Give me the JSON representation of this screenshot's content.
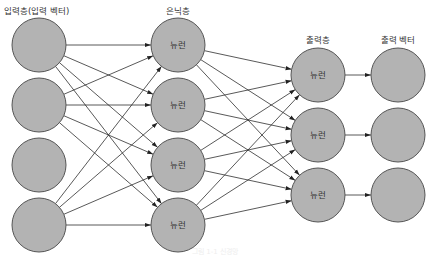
{
  "diagram": {
    "type": "neural-network",
    "colors": {
      "node_fill": "#b3b3b3",
      "node_stroke": "#555555",
      "edge": "#222222",
      "text": "#333333"
    },
    "layers": [
      {
        "id": "input",
        "label": "입력층(입력 벡터)",
        "label_x": 4,
        "label_y": 14,
        "label_anchor": "start",
        "cx": 39,
        "r": 27,
        "nodes": [
          {
            "cy": 45,
            "label": ""
          },
          {
            "cy": 105,
            "label": ""
          },
          {
            "cy": 165,
            "label": ""
          },
          {
            "cy": 225,
            "label": ""
          }
        ]
      },
      {
        "id": "hidden",
        "label": "은닉층",
        "label_x": 178,
        "label_y": 14,
        "label_anchor": "middle",
        "cx": 178,
        "r": 27,
        "nodes": [
          {
            "cy": 45,
            "label": "뉴런"
          },
          {
            "cy": 105,
            "label": "뉴런"
          },
          {
            "cy": 165,
            "label": "뉴런"
          },
          {
            "cy": 225,
            "label": "뉴런"
          }
        ]
      },
      {
        "id": "output",
        "label": "출력층",
        "label_x": 318,
        "label_y": 43,
        "label_anchor": "middle",
        "cx": 318,
        "r": 27,
        "nodes": [
          {
            "cy": 75,
            "label": "뉴런"
          },
          {
            "cy": 135,
            "label": "뉴런"
          },
          {
            "cy": 195,
            "label": "뉴런"
          }
        ]
      },
      {
        "id": "output-vector",
        "label": "출력 벡터",
        "label_x": 398,
        "label_y": 43,
        "label_anchor": "middle",
        "cx": 398,
        "r": 27,
        "nodes": [
          {
            "cy": 75,
            "label": ""
          },
          {
            "cy": 135,
            "label": ""
          },
          {
            "cy": 195,
            "label": ""
          }
        ]
      }
    ],
    "connections": [
      {
        "from_layer": 0,
        "to_layer": 1,
        "from_nodes": [
          0,
          1,
          3
        ],
        "to_nodes": [
          0,
          1,
          2,
          3
        ],
        "pattern": "full"
      },
      {
        "from_layer": 1,
        "to_layer": 2,
        "from_nodes": [
          0,
          1,
          2,
          3
        ],
        "to_nodes": [
          0,
          1,
          2
        ],
        "pattern": "full"
      },
      {
        "from_layer": 2,
        "to_layer": 3,
        "from_nodes": [
          0,
          1,
          2
        ],
        "to_nodes": [
          0,
          1,
          2
        ],
        "pattern": "one-to-one"
      }
    ],
    "caption": "그림 1-1 신경망"
  }
}
